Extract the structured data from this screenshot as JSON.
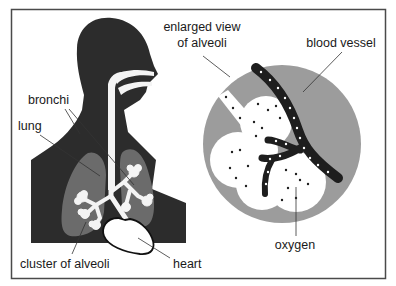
{
  "diagram": {
    "labels": {
      "enlarged_view_line1": "enlarged view",
      "enlarged_view_line2": "of alveoli",
      "blood_vessel": "blood vessel",
      "bronchi": "bronchi",
      "lung": "lung",
      "cluster_of_alveoli": "cluster of alveoli",
      "heart": "heart",
      "oxygen": "oxygen"
    },
    "colors": {
      "silhouette": "#2c2c2c",
      "lung": "#6b6b6b",
      "enlarged_circle": "#9c9c9c",
      "airway": "#f4f4f4",
      "frame": "#4a4a4a"
    }
  }
}
